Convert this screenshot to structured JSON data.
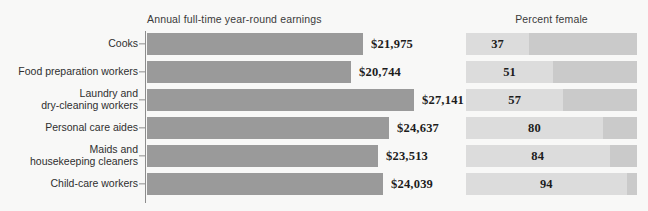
{
  "chart_data": {
    "type": "bar",
    "title": "",
    "panels": [
      {
        "key": "earnings",
        "title": "Annual full-time year-round earnings",
        "xlabel": "",
        "ylabel": "",
        "axis": true,
        "grid": false,
        "xlim": [
          0,
          30000
        ]
      },
      {
        "key": "percent_female",
        "title": "Percent female",
        "xlabel": "",
        "ylabel": "",
        "axis": false,
        "grid": false,
        "xlim": [
          0,
          100
        ]
      }
    ],
    "categories": [
      "Cooks",
      "Food preparation workers",
      "Laundry and\ndry-cleaning workers",
      "Personal care aides",
      "Maids and\nhousekeeping cleaners",
      "Child-care workers"
    ],
    "series": [
      {
        "name": "Annual full-time year-round earnings",
        "values": [
          21975,
          20744,
          27141,
          24637,
          23513,
          24039
        ],
        "labels": [
          "$21,975",
          "$20,744",
          "$27,141",
          "$24,637",
          "$23,513",
          "$24,039"
        ]
      },
      {
        "name": "Percent female",
        "values": [
          37,
          51,
          57,
          80,
          84,
          94
        ],
        "labels": [
          "37",
          "51",
          "57",
          "80",
          "84",
          "94"
        ]
      }
    ],
    "colors": {
      "background": "#f8f8f7",
      "earnings_bar": "#9a9a9a",
      "percent_fill": "#dcdcdc",
      "percent_track": "#cacaca",
      "axis": "#8d8d8d",
      "text": "#2f2f2f",
      "value_text": "#1c1c1c"
    },
    "legend": null
  },
  "rows": [
    {
      "label": "Cooks",
      "earnings_label": "$21,975",
      "earnings_value": 21975,
      "percent_label": "37",
      "percent_value": 37
    },
    {
      "label": "Food preparation workers",
      "earnings_label": "$20,744",
      "earnings_value": 20744,
      "percent_label": "51",
      "percent_value": 51
    },
    {
      "label": "Laundry and\ndry-cleaning workers",
      "earnings_label": "$27,141",
      "earnings_value": 27141,
      "percent_label": "57",
      "percent_value": 57
    },
    {
      "label": "Personal care aides",
      "earnings_label": "$24,637",
      "earnings_value": 24637,
      "percent_label": "80",
      "percent_value": 80
    },
    {
      "label": "Maids and\nhousekeeping cleaners",
      "earnings_label": "$23,513",
      "earnings_value": 23513,
      "percent_label": "84",
      "percent_value": 84
    },
    {
      "label": "Child-care workers",
      "earnings_label": "$24,039",
      "earnings_value": 24039,
      "percent_label": "94",
      "percent_value": 94
    }
  ],
  "titles": {
    "earnings": "Annual full-time year-round earnings",
    "percent": "Percent female"
  }
}
